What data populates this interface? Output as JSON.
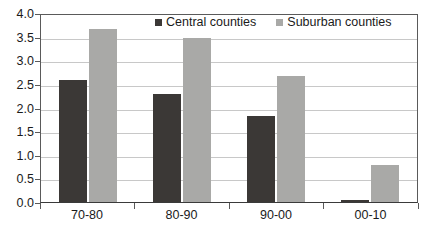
{
  "chart_data": {
    "type": "bar",
    "title": "",
    "subtitle": "",
    "xlabel": "",
    "ylabel": "",
    "categories": [
      "70-80",
      "80-90",
      "90-00",
      "00-10"
    ],
    "series": [
      {
        "name": "Central counties",
        "color": "#3b3836",
        "values": [
          2.6,
          2.3,
          1.85,
          0.05
        ]
      },
      {
        "name": "Suburban counties",
        "color": "#a9a9a7",
        "values": [
          3.7,
          3.5,
          2.7,
          0.8
        ]
      }
    ],
    "ylim": [
      0.0,
      4.0
    ],
    "y_tick_step": 0.5,
    "y_tick_labels": [
      "4.0",
      "3.5",
      "3.0",
      "2.5",
      "2.0",
      "1.5",
      "1.0",
      "0.5",
      "0.0"
    ],
    "y_tick_values": [
      4.0,
      3.5,
      3.0,
      2.5,
      2.0,
      1.5,
      1.0,
      0.5,
      0.0
    ],
    "grid": true,
    "grid_axis": "y",
    "legend": [
      "Central counties",
      "Suburban counties"
    ],
    "legend_position": "top-center"
  },
  "axis": {
    "y_labels": [
      "4.0",
      "3.5",
      "3.0",
      "2.5",
      "2.0",
      "1.5",
      "1.0",
      "0.5",
      "0.0"
    ],
    "x_labels": [
      "70-80",
      "80-90",
      "90-00",
      "00-10"
    ]
  },
  "legend": {
    "entries": [
      {
        "label": "Central counties",
        "color": "#3b3836"
      },
      {
        "label": "Suburban counties",
        "color": "#a9a9a7"
      }
    ]
  },
  "colors": {
    "central": "#3b3836",
    "suburban": "#a9a9a7",
    "gridline": "#c8c8c8",
    "axis": "#5a5a5a",
    "background": "#ffffff",
    "text": "#1a1a1a"
  }
}
